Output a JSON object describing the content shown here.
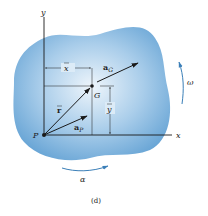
{
  "figure": {
    "caption": "(d)",
    "colors": {
      "body_fill_center": "#e4f0fa",
      "body_fill_edge": "#6aa6d6",
      "line": "#1a1a1a",
      "rotation_arrow": "#3b7fb8"
    },
    "labels": {
      "y_axis": "y",
      "x_axis": "x",
      "point_P": "P",
      "point_G": "G",
      "x_bar": "x",
      "y_bar": "y",
      "r_bar": "r",
      "a_G_main": "a",
      "a_G_sub": "G",
      "a_P_main": "a",
      "a_P_sub": "P",
      "omega": "ω",
      "alpha": "α"
    }
  }
}
